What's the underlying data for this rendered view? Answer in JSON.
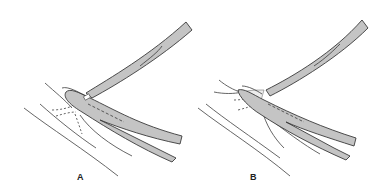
{
  "figure": {
    "panels": [
      {
        "label": "A",
        "description": "Two curved forceps/clamps grasping tissue; strands of tissue at the tip"
      },
      {
        "label": "B",
        "description": "Forceps opened apart with tissue spread between jaws"
      }
    ],
    "colors": {
      "instrument_fill": "#c4c4c4",
      "outline": "#3a3a3a",
      "tissue_line": "#555555",
      "background": "#ffffff"
    }
  }
}
